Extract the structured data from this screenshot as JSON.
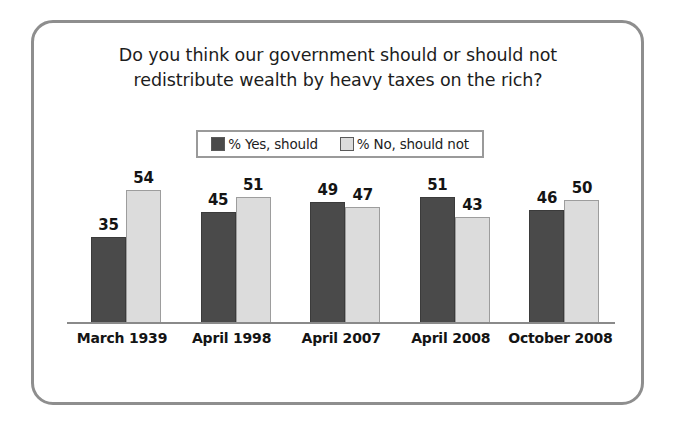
{
  "chart_data": {
    "type": "bar",
    "title_line1": "Do you think our government should or should not",
    "title_line2": "redistribute wealth by heavy taxes on the rich?",
    "title": "Do you think our government should or should not redistribute wealth by heavy taxes on the rich?",
    "xlabel": "",
    "ylabel": "",
    "ylim": [
      0,
      60
    ],
    "grid": false,
    "legend_position": "top-center",
    "categories": [
      "March 1939",
      "April 1998",
      "April 2007",
      "April 2008",
      "October 2008"
    ],
    "series": [
      {
        "name": "% Yes, should",
        "color": "#4a4a4a",
        "values": [
          35,
          45,
          49,
          51,
          46
        ]
      },
      {
        "name": "% No, should not",
        "color": "#dcdcdc",
        "values": [
          54,
          51,
          47,
          43,
          50
        ]
      }
    ]
  },
  "legend": {
    "items": [
      {
        "label": "% Yes, should",
        "swatch": "dark-gray-swatch"
      },
      {
        "label": "% No, should not",
        "swatch": "light-gray-swatch"
      }
    ]
  },
  "colors": {
    "series_yes": "#4a4a4a",
    "series_no": "#dcdcdc",
    "frame_border": "#8e8e8e",
    "axis_line": "#8a8a8a",
    "text": "#141414",
    "background": "#ffffff"
  }
}
